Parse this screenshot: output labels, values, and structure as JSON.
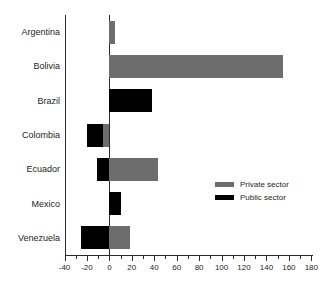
{
  "chart_data": {
    "type": "bar",
    "orientation": "horizontal",
    "title": "",
    "xlabel": "",
    "ylabel": "",
    "categories": [
      "Argentina",
      "Bolivia",
      "Brazil",
      "Colombia",
      "Ecuador",
      "Mexico",
      "Venezuela"
    ],
    "series": [
      {
        "name": "Public sector",
        "color": "#000000",
        "values": [
          0,
          0,
          38,
          -20,
          -11,
          10,
          -25
        ]
      },
      {
        "name": "Private sector",
        "color": "#6d6d6d",
        "values": [
          5,
          155,
          0,
          -6,
          43,
          0,
          18
        ]
      }
    ],
    "axis": {
      "x_min": -40,
      "x_max": 180,
      "major_step": 20,
      "minor_step": 10,
      "tick_labels": [
        "-40",
        "-20",
        "0",
        "20",
        "40",
        "60",
        "80",
        "100",
        "120",
        "140",
        "160",
        "180"
      ]
    },
    "legend": {
      "position": "middle-right",
      "entries": [
        {
          "label": "Private sector",
          "color": "#6d6d6d"
        },
        {
          "label": "Public sector",
          "color": "#000000"
        }
      ]
    },
    "grid": false,
    "background": "#ffffff",
    "axis_color": "#2b2b2b",
    "text_color": "#231f20"
  }
}
